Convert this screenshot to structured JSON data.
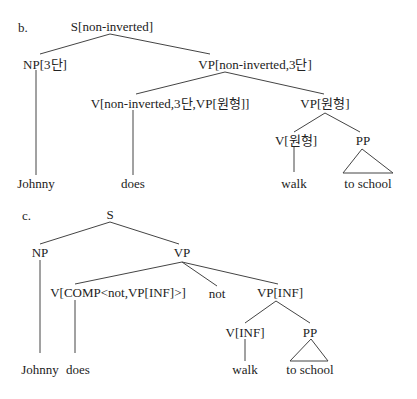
{
  "trees": {
    "b": {
      "marker": "b.",
      "root": "S[non-inverted]",
      "np": "NP[3단]",
      "vp": "VP[non-inverted,3단]",
      "v": "V[non-inverted,3단,VP[원형]]",
      "vp2": "VP[원형]",
      "v2": "V[원형]",
      "pp": "PP",
      "words": {
        "johnny": "Johnny",
        "does": "does",
        "walk": "walk",
        "to_school": "to  school"
      }
    },
    "c": {
      "marker": "c.",
      "root": "S",
      "np": "NP",
      "vp": "VP",
      "v": "V[COMP<not,VP[INF]>]",
      "not": "not",
      "vp2": "VP[INF]",
      "v2": "V[INF]",
      "pp": "PP",
      "words": {
        "johnny": "Johnny",
        "does": "does",
        "walk": "walk",
        "to_school": "to  school"
      }
    }
  }
}
